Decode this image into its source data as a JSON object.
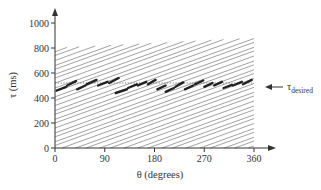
{
  "chart_data": {
    "type": "line",
    "title": "",
    "xlabel": "θ (degrees)",
    "ylabel": "τ (ms)",
    "xlim": [
      0,
      360
    ],
    "ylim": [
      0,
      1000
    ],
    "x_ticks": [
      0,
      90,
      180,
      270,
      360
    ],
    "y_ticks": [
      0,
      200,
      400,
      600,
      800,
      1000
    ],
    "grid": false,
    "legend": null,
    "annotation": {
      "label": "τ",
      "subscript": "desired",
      "arrow": "left",
      "y": 520
    },
    "reference_line": {
      "name": "τ desired",
      "y": 520,
      "style": "dotted"
    },
    "background_lines": {
      "description": "family of parallel diagonal lines with constant positive slope, clipped to plot region",
      "slope_ms_per_deg": 1.6,
      "intercepts_ms": [
        -560,
        -520,
        -490,
        -450,
        -420,
        -380,
        -340,
        -310,
        -270,
        -240,
        -200,
        -160,
        -130,
        -90,
        -60,
        -20,
        20,
        50,
        90,
        120,
        160,
        200,
        230,
        270,
        300,
        340,
        380,
        410,
        450,
        480,
        520,
        560,
        590,
        630,
        660,
        700,
        740,
        770,
        810
      ],
      "top_boundary_ms": [
        [
          0,
          800
        ],
        [
          360,
          880
        ]
      ],
      "color": "#8a8a8a"
    },
    "series": [
      {
        "name": "trajectory (thick sawtooth)",
        "style": "thick",
        "segments": [
          [
            [
              3,
              460
            ],
            [
              20,
              490
            ]
          ],
          [
            [
              22,
              500
            ],
            [
              38,
              535
            ]
          ],
          [
            [
              40,
              470
            ],
            [
              55,
              500
            ]
          ],
          [
            [
              57,
              510
            ],
            [
              75,
              545
            ]
          ],
          [
            [
              78,
              500
            ],
            [
              95,
              530
            ]
          ],
          [
            [
              98,
              520
            ],
            [
              115,
              560
            ]
          ],
          [
            [
              110,
              440
            ],
            [
              130,
              470
            ]
          ],
          [
            [
              132,
              480
            ],
            [
              148,
              510
            ]
          ],
          [
            [
              150,
              500
            ],
            [
              165,
              530
            ]
          ],
          [
            [
              168,
              510
            ],
            [
              182,
              545
            ]
          ],
          [
            [
              185,
              470
            ],
            [
              200,
              500
            ]
          ],
          [
            [
              200,
              450
            ],
            [
              215,
              480
            ]
          ],
          [
            [
              218,
              490
            ],
            [
              232,
              525
            ]
          ],
          [
            [
              235,
              470
            ],
            [
              250,
              500
            ]
          ],
          [
            [
              253,
              510
            ],
            [
              268,
              540
            ]
          ],
          [
            [
              270,
              490
            ],
            [
              285,
              520
            ]
          ],
          [
            [
              288,
              500
            ],
            [
              302,
              530
            ]
          ],
          [
            [
              305,
              480
            ],
            [
              320,
              505
            ]
          ],
          [
            [
              322,
              500
            ],
            [
              338,
              530
            ]
          ],
          [
            [
              340,
              510
            ],
            [
              356,
              545
            ]
          ]
        ]
      }
    ]
  },
  "layout": {
    "plot_origin_px": [
      55,
      148
    ],
    "x_px_per_unit": 0.5528,
    "y_px_per_unit": 0.125,
    "x_axis_end_px": 276,
    "y_axis_end_px": 8
  }
}
